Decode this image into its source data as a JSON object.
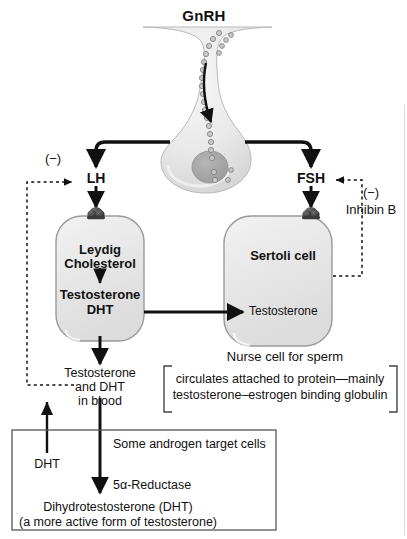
{
  "figure": {
    "type": "diagram",
    "hormone_top": "GnRH",
    "pituitary_label": "pituitary gland"
  },
  "gonadotropins": {
    "lh": "LH",
    "fsh": "FSH"
  },
  "feedback": {
    "left_sign": "(−)",
    "right_sign": "(−)",
    "right_agent": "Inhibin B"
  },
  "leydig": {
    "name": "Leydig",
    "substrate": "Cholesterol",
    "product_1": "Testosterone",
    "product_2": "DHT"
  },
  "sertoli": {
    "name": "Sertoli cell",
    "received": "Testosterone",
    "caption": "Nurse cell for sperm"
  },
  "blood": {
    "line1": "Testosterone",
    "line2": "and DHT",
    "line3": "in blood"
  },
  "bracket": {
    "line1": "circulates attached to protein—mainly",
    "line2": "testosterone–estrogen binding globulin"
  },
  "target_box": {
    "title": "Some androgen target cells",
    "enzyme": "5α-Reductase",
    "input": "DHT",
    "product_line1": "Dihydrotestosterone (DHT)",
    "product_line2": "(a more active form of testosterone)"
  },
  "colors": {
    "ink": "#111111",
    "cell_fill": "#e9e9e9",
    "cell_stroke": "#9a9a9a",
    "gland_fill": "#ededed",
    "nucleus": "#a8a8a8",
    "box_stroke": "#555555",
    "page_edge": "#d8d8d8"
  }
}
